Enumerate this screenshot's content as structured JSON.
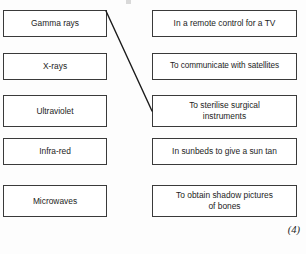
{
  "page": {
    "background_color": "#fdfdfd",
    "box_border_color": "#3a3a3a",
    "line_color": "#1b1b1b",
    "text_color": "#1d1d1d"
  },
  "exercise": {
    "type": "matching",
    "left_column_title": "",
    "right_column_title": "",
    "left_items": [
      {
        "id": "gamma-rays",
        "label": "Gamma rays"
      },
      {
        "id": "x-rays",
        "label": "X-rays"
      },
      {
        "id": "ultraviolet",
        "label": "Ultraviolet"
      },
      {
        "id": "infra-red",
        "label": "Infra-red"
      },
      {
        "id": "microwaves",
        "label": "Microwaves"
      }
    ],
    "right_items": [
      {
        "id": "remote-control",
        "label": "In a remote control for a TV"
      },
      {
        "id": "satellites",
        "label": "To communicate with satellites"
      },
      {
        "id": "sterilise",
        "label": "To sterilise surgical\ninstruments"
      },
      {
        "id": "sunbeds",
        "label": "In sunbeds to give a sun tan"
      },
      {
        "id": "shadow-pictures",
        "label": "To obtain shadow pictures\nof bones"
      }
    ],
    "connections": [
      {
        "id": "gamma-to-sterilise",
        "from": "gamma-rays",
        "to": "sterilise",
        "x1": 106,
        "y1": 11,
        "x2": 152,
        "y2": 111
      }
    ]
  },
  "marks": {
    "value": "(4)"
  }
}
